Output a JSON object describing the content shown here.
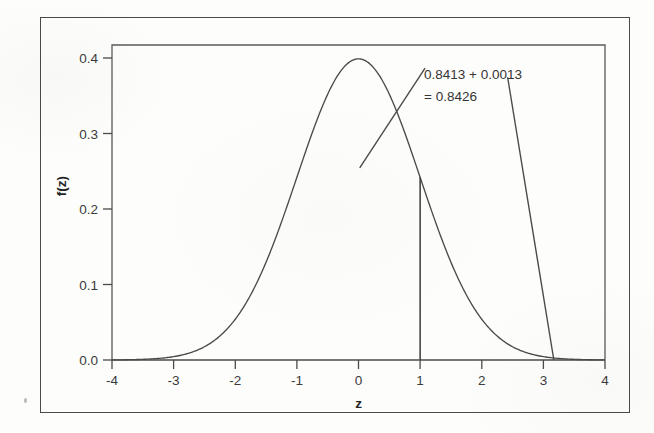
{
  "figure": {
    "background_color": "#fdfdfc",
    "ink_color": "#3b3b3b",
    "outer_border_color": "#4a4a4a"
  },
  "chart_data": {
    "type": "line",
    "title": "",
    "subtitle": "",
    "xlabel": "z",
    "ylabel": "f(z)",
    "xlim": [
      -4,
      4
    ],
    "ylim": [
      0.0,
      0.42
    ],
    "grid": false,
    "legend": null,
    "x_ticks": [
      -4,
      -3,
      -2,
      -1,
      0,
      1,
      2,
      3,
      4
    ],
    "x_tick_labels": [
      "-4",
      "-3",
      "-2",
      "-1",
      "0",
      "1",
      "2",
      "3",
      "4"
    ],
    "y_ticks": [
      0.0,
      0.1,
      0.2,
      0.3,
      0.4
    ],
    "y_tick_labels": [
      "0.0",
      "0.1",
      "0.2",
      "0.3",
      "0.4"
    ],
    "series": [
      {
        "name": "standard normal density",
        "type": "line",
        "color": "#4a4a4a",
        "description": "f(z) = (1/sqrt(2*pi)) * exp(-z^2/2)",
        "x": [
          -4.0,
          -3.8,
          -3.6,
          -3.4,
          -3.2,
          -3.0,
          -2.8,
          -2.6,
          -2.4,
          -2.2,
          -2.0,
          -1.8,
          -1.6,
          -1.4,
          -1.2,
          -1.0,
          -0.8,
          -0.6,
          -0.4,
          -0.2,
          0.0,
          0.2,
          0.4,
          0.6,
          0.8,
          1.0,
          1.2,
          1.4,
          1.6,
          1.8,
          2.0,
          2.2,
          2.4,
          2.6,
          2.8,
          3.0,
          3.2,
          3.4,
          3.6,
          3.8,
          4.0
        ],
        "y": [
          0.0001,
          0.0003,
          0.0006,
          0.0012,
          0.0024,
          0.0044,
          0.0079,
          0.0136,
          0.0224,
          0.0355,
          0.054,
          0.079,
          0.1109,
          0.1497,
          0.1942,
          0.242,
          0.2897,
          0.3332,
          0.3683,
          0.391,
          0.3989,
          0.391,
          0.3683,
          0.3332,
          0.2897,
          0.242,
          0.1942,
          0.1497,
          0.1109,
          0.079,
          0.054,
          0.0355,
          0.0224,
          0.0136,
          0.0079,
          0.0044,
          0.0024,
          0.0012,
          0.0006,
          0.0003,
          0.0001
        ]
      }
    ],
    "markers": [
      {
        "name": "vertical-line-at-z-1",
        "type": "vline",
        "x": 1.0,
        "y_from": 0.0,
        "y_to": 0.242,
        "color": "#3b3b3b"
      }
    ],
    "annotations": [
      {
        "name": "probability-annotation",
        "line1": "0.8413 + 0.0013",
        "line2": "= 0.8426",
        "text_x": 1.08,
        "text_y": 0.3995,
        "leaders": [
          {
            "name": "leader-to-z-1",
            "from_x": 1.08,
            "from_y": 0.3865,
            "to_x": 0.02,
            "to_y": 0.2545
          },
          {
            "name": "leader-to-z-3p2",
            "from_x": 2.42,
            "from_y": 0.3745,
            "to_x": 3.17,
            "to_y": 0.0
          }
        ]
      }
    ]
  }
}
